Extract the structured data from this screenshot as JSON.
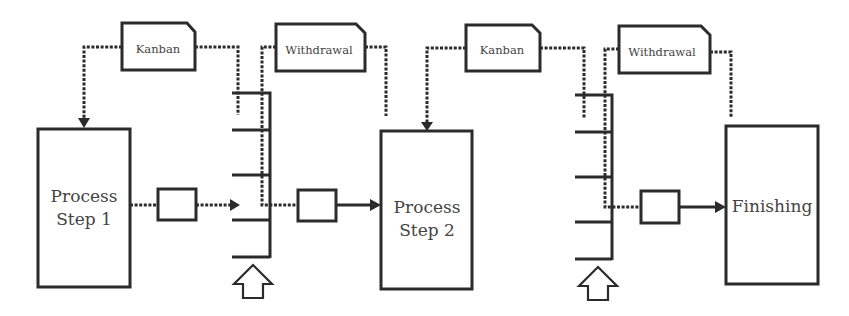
{
  "diagram": {
    "title": "",
    "colors": {
      "line": "#2b2b2b",
      "text": "#444444",
      "background": "#ffffff"
    },
    "cards": [
      {
        "id": "kanban-1",
        "label": "Kanban"
      },
      {
        "id": "withdrawal-1",
        "label": "Withdrawal"
      },
      {
        "id": "kanban-2",
        "label": "Kanban"
      },
      {
        "id": "withdrawal-2",
        "label": "Withdrawal"
      }
    ],
    "processes": [
      {
        "id": "step-1",
        "lines": [
          "Process",
          "Step 1"
        ]
      },
      {
        "id": "step-2",
        "lines": [
          "Process",
          "Step 2"
        ]
      },
      {
        "id": "finishing",
        "lines": [
          "Finishing"
        ]
      }
    ],
    "buffers": [
      {
        "id": "buffer-1",
        "shelves": 5
      },
      {
        "id": "buffer-2",
        "shelves": 5
      }
    ],
    "transfer_boxes": [
      {
        "id": "wip-box-1"
      },
      {
        "id": "wip-box-2"
      },
      {
        "id": "wip-box-3"
      }
    ],
    "legend": {
      "dashed_line": "information / kanban flow",
      "solid_line": "material flow"
    }
  }
}
